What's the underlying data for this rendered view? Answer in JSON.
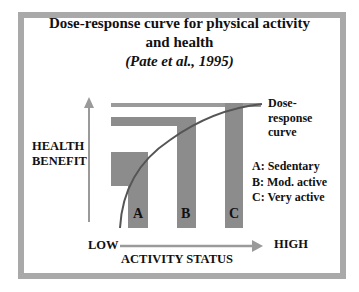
{
  "title": {
    "line1": "Dose-response curve for physical activity",
    "line2": "and health",
    "citation": "(Pate et al., 1995)"
  },
  "y_axis": {
    "label_line1": "HEALTH",
    "label_line2": "BENEFIT"
  },
  "x_axis": {
    "low": "LOW",
    "high": "HIGH",
    "label": "ACTIVITY STATUS"
  },
  "curve_label": {
    "line1": "Dose-",
    "line2": "response",
    "line3": "curve"
  },
  "bars": [
    {
      "id": "A",
      "label": "A"
    },
    {
      "id": "B",
      "label": "B"
    },
    {
      "id": "C",
      "label": "C"
    }
  ],
  "legend": [
    {
      "text": "A: Sedentary"
    },
    {
      "text": "B: Mod. active"
    },
    {
      "text": "C: Very active"
    }
  ],
  "colors": {
    "frame": "#a9a9a9",
    "bar": "#8c8c8c",
    "curve": "#555555",
    "axis": "#999999"
  }
}
